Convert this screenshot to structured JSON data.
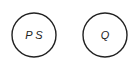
{
  "diagram": {
    "nodes": [
      {
        "id": "node-ps",
        "label": "P S",
        "cx": 34,
        "cy": 35,
        "r": 22
      },
      {
        "id": "node-q",
        "label": "Q",
        "cx": 105,
        "cy": 35,
        "r": 22
      }
    ],
    "stroke_color": "#222222",
    "background": "#ffffff"
  }
}
